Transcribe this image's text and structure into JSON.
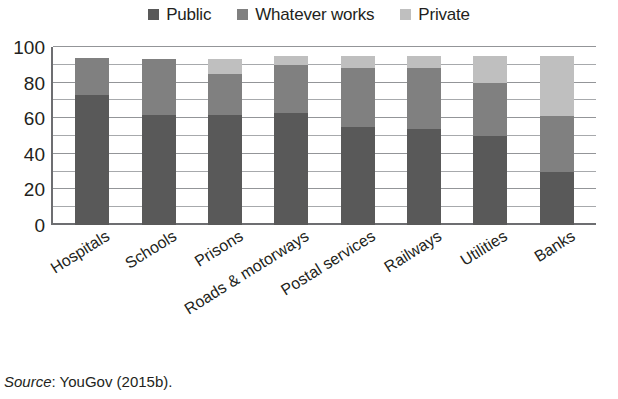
{
  "chart_data": {
    "type": "bar",
    "subtype": "stacked-column",
    "title": "",
    "subtitle": "",
    "xlabel": "",
    "ylabel": "",
    "ylim": [
      0,
      100
    ],
    "yticks": [
      0,
      20,
      40,
      60,
      80,
      100
    ],
    "ytick_labels": [
      "0",
      "20",
      "40",
      "60",
      "80",
      "100"
    ],
    "minor_tick_step": 10,
    "grid": true,
    "grid_axis": "y",
    "legend_position": "top-center",
    "categories": [
      "Hospitals",
      "Schools",
      "Prisons",
      "Roads & motorways",
      "Postal services",
      "Railways",
      "Utilities",
      "Banks"
    ],
    "series": [
      {
        "name": "Public",
        "color": "#595959",
        "values": [
          73,
          62,
          62,
          63,
          55,
          54,
          50,
          30
        ]
      },
      {
        "name": "Whatever works",
        "color": "#808080",
        "values": [
          21,
          31,
          23,
          27,
          33,
          34,
          30,
          31
        ]
      },
      {
        "name": "Private",
        "color": "#bfbfbf",
        "values": [
          0,
          0,
          8,
          5,
          7,
          7,
          15,
          34
        ]
      }
    ],
    "totals": [
      94,
      93,
      93,
      95,
      95,
      95,
      95,
      95
    ]
  },
  "legend": {
    "items": [
      {
        "label": "Public",
        "color": "#595959"
      },
      {
        "label": "Whatever works",
        "color": "#808080"
      },
      {
        "label": "Private",
        "color": "#bfbfbf"
      }
    ]
  },
  "source_note": {
    "label": "Source",
    "separator": ": ",
    "text": "YouGov (2015b)."
  },
  "colors": {
    "public": "#595959",
    "whatever_works": "#808080",
    "private": "#bfbfbf",
    "axis": "#6d6e71",
    "gridline": "#a7a9ac",
    "text": "#231f20",
    "background": "#ffffff"
  }
}
